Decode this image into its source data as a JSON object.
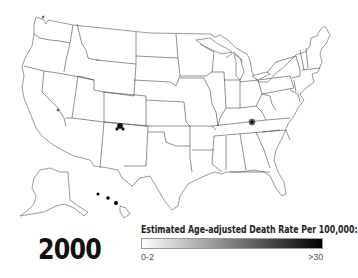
{
  "map": {
    "title": "Estimated Age-adjusted Death Rate Per 100,000:",
    "region": "United States (states, incl. Alaska and Hawaii insets)",
    "year_label": "2000",
    "hotspots": [
      {
        "location": "northern New Mexico / southern Colorado border",
        "shade": "dark"
      },
      {
        "location": "eastern Kentucky / Tennessee border",
        "shade": "dark"
      },
      {
        "location": "western Nevada",
        "shade": "light"
      },
      {
        "location": "northwestern Washington",
        "shade": "light"
      }
    ]
  },
  "legend": {
    "title": "Estimated Age-adjusted Death Rate Per 100,000:",
    "min_label": "0-2",
    "max_label": ">30",
    "gradient_start": "#ffffff",
    "gradient_end": "#000000"
  },
  "colors": {
    "background": "#ffffff",
    "state_border": "#555555",
    "state_fill": "#ffffff"
  }
}
